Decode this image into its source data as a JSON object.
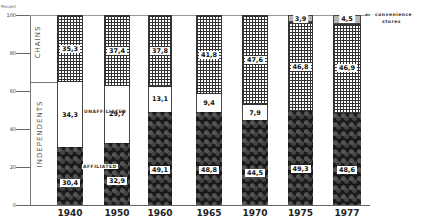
{
  "chart_data": {
    "type": "bar",
    "stacked": true,
    "title": "",
    "ylabel": "Percent",
    "xlabel": "",
    "ylim": [
      0,
      100
    ],
    "yticks": [
      0,
      20,
      40,
      60,
      80,
      100
    ],
    "categories": [
      "1940",
      "1950",
      "1960",
      "1965",
      "1970",
      "1975",
      "1977"
    ],
    "group_labels": {
      "chains": "CHAINS",
      "independents": "INDEPENDENTS"
    },
    "series": [
      {
        "name": "AFFILIATED",
        "group": "independents",
        "values": [
          30.4,
          32.9,
          49.1,
          48.8,
          44.5,
          49.3,
          48.6
        ],
        "labels": [
          "30,4",
          "32,9",
          "49,1",
          "48,8",
          "44,5",
          "49,3",
          "48,6"
        ]
      },
      {
        "name": "UNAFFILIATED",
        "group": "independents",
        "values": [
          34.3,
          29.7,
          13.1,
          9.4,
          7.9,
          0,
          0
        ],
        "labels": [
          "34,3",
          "29,7",
          "13,1",
          "9,4",
          "7,9",
          "",
          ""
        ]
      },
      {
        "name": "CHAINS",
        "group": "chains",
        "values": [
          35.3,
          37.4,
          37.8,
          41.8,
          47.6,
          46.8,
          46.9
        ],
        "labels": [
          "35,3",
          "37,4",
          "37,8",
          "41,8",
          "47,6",
          "46,8",
          "46,9"
        ]
      },
      {
        "name": "convenience stores",
        "group": "chains",
        "values": [
          0,
          0,
          0,
          0,
          0,
          3.9,
          4.5
        ],
        "labels": [
          "",
          "",
          "",
          "",
          "",
          "3,9",
          "4,5"
        ]
      }
    ],
    "annotations": [
      "UNAFFILIATED",
      "AFFILIATED",
      "convenience stores"
    ],
    "grid": false,
    "legend": "inline annotations"
  },
  "axis": {
    "unit_label": "Percent",
    "ticks": [
      "0",
      "20",
      "40",
      "60",
      "80",
      "100"
    ]
  },
  "annotations": {
    "unaffiliated": "UNAFFILIATED",
    "affiliated": "AFFILIATED",
    "convenience_line1": "convenience",
    "convenience_line2": "stores",
    "arrow": "←",
    "chains": "CHAINS",
    "independents": "INDEPENDENTS"
  }
}
